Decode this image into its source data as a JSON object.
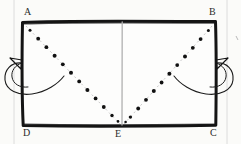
{
  "figure": {
    "type": "geometry-fold-diagram",
    "background_color": "#fbfbf9",
    "ink_color": "#1a1a1a",
    "guide_color": "#c9c9c9",
    "rectangle": {
      "name": "ABCD",
      "left": 22,
      "top": 21,
      "right": 216,
      "bottom": 126,
      "stroke_width": 3
    },
    "vertices": [
      {
        "id": "A",
        "label": "A",
        "position": "top-left",
        "x": 22,
        "y": 21
      },
      {
        "id": "B",
        "label": "B",
        "position": "top-right",
        "x": 216,
        "y": 21
      },
      {
        "id": "C",
        "label": "C",
        "position": "bottom-right",
        "x": 216,
        "y": 126
      },
      {
        "id": "D",
        "label": "D",
        "position": "bottom-left",
        "x": 22,
        "y": 126
      },
      {
        "id": "E",
        "label": "E",
        "position": "bottom-center",
        "x": 122,
        "y": 126
      }
    ],
    "fold_lines": [
      {
        "id": "fold-AE",
        "from": "A",
        "to": "E",
        "style": "dotted",
        "dot_count": 12,
        "color": "#111111"
      },
      {
        "id": "fold-BE",
        "from": "B",
        "to": "E",
        "style": "dotted",
        "dot_count": 12,
        "color": "#111111"
      }
    ],
    "center_line": {
      "id": "center-vertical",
      "from_x": 122,
      "from_y": 21,
      "to_x": 122,
      "to_y": 126,
      "style": "solid-thin",
      "color": "#aaaaaa"
    },
    "fold_arrows": [
      {
        "id": "left-fold-arrow",
        "side": "left",
        "shape": "looping-curve",
        "direction": "inward-fold",
        "arrowhead": "triangular"
      },
      {
        "id": "right-fold-arrow",
        "side": "right",
        "shape": "looping-curve",
        "direction": "inward-fold",
        "arrowhead": "triangular"
      }
    ],
    "page_guides": [
      {
        "id": "left-margin-rule",
        "x": 14,
        "color": "#dcdcdc"
      },
      {
        "id": "right-margin-rule",
        "x": 227,
        "color": "#dcdcdc"
      }
    ]
  }
}
